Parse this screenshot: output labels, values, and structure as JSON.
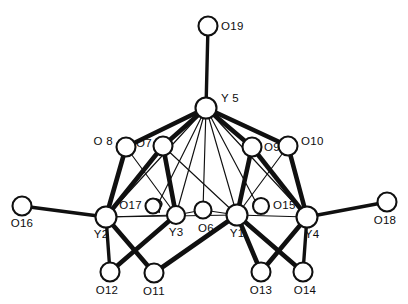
{
  "figure": {
    "kind": "molecular-structure-diagram",
    "title": "",
    "background_color": "#ffffff",
    "line_color": "#101010",
    "atom_fill_color": "#ffffff",
    "width": 408,
    "height": 304
  },
  "atoms": [
    {
      "id": "O19",
      "label": "O19",
      "element": "O",
      "cx": 208,
      "cy": 26,
      "r": 9.5,
      "label_x": 221,
      "label_y": 30,
      "label_anchor": "start"
    },
    {
      "id": "Y5",
      "label": "Y 5",
      "element": "Y",
      "cx": 206,
      "cy": 108,
      "r": 10.5,
      "label_x": 221,
      "label_y": 102,
      "label_anchor": "start"
    },
    {
      "id": "O8",
      "label": "O 8",
      "element": "O",
      "cx": 126,
      "cy": 147,
      "r": 9.5,
      "label_x": 113,
      "label_y": 145,
      "label_anchor": "end"
    },
    {
      "id": "O7",
      "label": "O7",
      "element": "O",
      "cx": 163,
      "cy": 146,
      "r": 9.5,
      "label_x": 152,
      "label_y": 147,
      "label_anchor": "end"
    },
    {
      "id": "O9",
      "label": "O9",
      "element": "O",
      "cx": 252,
      "cy": 147,
      "r": 9.5,
      "label_x": 264,
      "label_y": 151,
      "label_anchor": "start"
    },
    {
      "id": "O10",
      "label": "O10",
      "element": "O",
      "cx": 288,
      "cy": 146,
      "r": 9.5,
      "label_x": 301,
      "label_y": 145,
      "label_anchor": "start"
    },
    {
      "id": "O16",
      "label": "O16",
      "element": "O",
      "cx": 22,
      "cy": 206,
      "r": 9.5,
      "label_x": 22,
      "label_y": 227,
      "label_anchor": "middle"
    },
    {
      "id": "Y2",
      "label": "Y2",
      "element": "Y",
      "cx": 106,
      "cy": 217,
      "r": 10.5,
      "label_x": 101,
      "label_y": 238,
      "label_anchor": "middle"
    },
    {
      "id": "O17",
      "label": "O17",
      "element": "O",
      "cx": 153,
      "cy": 206,
      "r": 7.5,
      "label_x": 142,
      "label_y": 209,
      "label_anchor": "end"
    },
    {
      "id": "Y3",
      "label": "Y3",
      "element": "Y",
      "cx": 176,
      "cy": 215,
      "r": 9.0,
      "label_x": 176,
      "label_y": 236,
      "label_anchor": "middle"
    },
    {
      "id": "O6",
      "label": "O6",
      "element": "O",
      "cx": 203,
      "cy": 210,
      "r": 8.5,
      "label_x": 206,
      "label_y": 232,
      "label_anchor": "middle"
    },
    {
      "id": "Y1",
      "label": "Y1",
      "element": "Y",
      "cx": 237,
      "cy": 215,
      "r": 10.5,
      "label_x": 237,
      "label_y": 237,
      "label_anchor": "middle"
    },
    {
      "id": "O15",
      "label": "O15",
      "element": "O",
      "cx": 261,
      "cy": 206,
      "r": 8.0,
      "label_x": 273,
      "label_y": 209,
      "label_anchor": "start"
    },
    {
      "id": "Y4",
      "label": "Y4",
      "element": "Y",
      "cx": 307,
      "cy": 217,
      "r": 10.5,
      "label_x": 312,
      "label_y": 238,
      "label_anchor": "middle"
    },
    {
      "id": "O18",
      "label": "O18",
      "element": "O",
      "cx": 387,
      "cy": 202,
      "r": 9.5,
      "label_x": 385,
      "label_y": 224,
      "label_anchor": "middle"
    },
    {
      "id": "O12",
      "label": "O12",
      "element": "O",
      "cx": 110,
      "cy": 272,
      "r": 9.5,
      "label_x": 107,
      "label_y": 294,
      "label_anchor": "middle"
    },
    {
      "id": "O11",
      "label": "O11",
      "element": "O",
      "cx": 154,
      "cy": 273,
      "r": 9.5,
      "label_x": 154,
      "label_y": 295,
      "label_anchor": "middle"
    },
    {
      "id": "O13",
      "label": "O13",
      "element": "O",
      "cx": 261,
      "cy": 272,
      "r": 9.5,
      "label_x": 261,
      "label_y": 294,
      "label_anchor": "middle"
    },
    {
      "id": "O14",
      "label": "O14",
      "element": "O",
      "cx": 303,
      "cy": 272,
      "r": 9.5,
      "label_x": 305,
      "label_y": 294,
      "label_anchor": "middle"
    }
  ],
  "bonds": [
    {
      "from": "O19",
      "to": "Y5",
      "weight": "medium"
    },
    {
      "from": "Y5",
      "to": "O8",
      "weight": "thick"
    },
    {
      "from": "Y5",
      "to": "O7",
      "weight": "thick"
    },
    {
      "from": "Y5",
      "to": "O9",
      "weight": "thick"
    },
    {
      "from": "Y5",
      "to": "O10",
      "weight": "thick"
    },
    {
      "from": "Y5",
      "to": "Y2",
      "weight": "thin"
    },
    {
      "from": "Y5",
      "to": "Y3",
      "weight": "thin"
    },
    {
      "from": "Y5",
      "to": "Y1",
      "weight": "thin"
    },
    {
      "from": "Y5",
      "to": "Y4",
      "weight": "thin"
    },
    {
      "from": "Y5",
      "to": "O6",
      "weight": "thin"
    },
    {
      "from": "Y5",
      "to": "O17",
      "weight": "thin"
    },
    {
      "from": "Y5",
      "to": "O15",
      "weight": "thin"
    },
    {
      "from": "O8",
      "to": "Y2",
      "weight": "thick"
    },
    {
      "from": "O7",
      "to": "Y2",
      "weight": "thick"
    },
    {
      "from": "O7",
      "to": "Y3",
      "weight": "thick"
    },
    {
      "from": "O7",
      "to": "Y1",
      "weight": "thin"
    },
    {
      "from": "O9",
      "to": "Y4",
      "weight": "thick"
    },
    {
      "from": "O9",
      "to": "Y1",
      "weight": "thick"
    },
    {
      "from": "O10",
      "to": "Y4",
      "weight": "thick"
    },
    {
      "from": "O10",
      "to": "Y1",
      "weight": "thin"
    },
    {
      "from": "O16",
      "to": "Y2",
      "weight": "medium"
    },
    {
      "from": "O18",
      "to": "Y4",
      "weight": "medium"
    },
    {
      "from": "Y2",
      "to": "Y3",
      "weight": "thin"
    },
    {
      "from": "Y2",
      "to": "Y1",
      "weight": "thin"
    },
    {
      "from": "Y3",
      "to": "O6",
      "weight": "thin"
    },
    {
      "from": "O6",
      "to": "Y1",
      "weight": "thin"
    },
    {
      "from": "Y1",
      "to": "Y4",
      "weight": "thin"
    },
    {
      "from": "Y2",
      "to": "O12",
      "weight": "medium"
    },
    {
      "from": "Y2",
      "to": "O11",
      "weight": "thick"
    },
    {
      "from": "Y3",
      "to": "O12",
      "weight": "thick"
    },
    {
      "from": "Y1",
      "to": "O11",
      "weight": "thick"
    },
    {
      "from": "Y1",
      "to": "O13",
      "weight": "thick"
    },
    {
      "from": "Y1",
      "to": "O14",
      "weight": "thick"
    },
    {
      "from": "Y4",
      "to": "O13",
      "weight": "thick"
    },
    {
      "from": "Y4",
      "to": "O14",
      "weight": "medium"
    },
    {
      "from": "Y3",
      "to": "O17",
      "weight": "thin"
    },
    {
      "from": "Y1",
      "to": "O15",
      "weight": "thin"
    }
  ],
  "callouts": [
    {
      "id": "o17-pointer",
      "label": "O17",
      "target": "O17"
    },
    {
      "id": "o15-pointer",
      "label": "O15",
      "target": "O15"
    }
  ]
}
